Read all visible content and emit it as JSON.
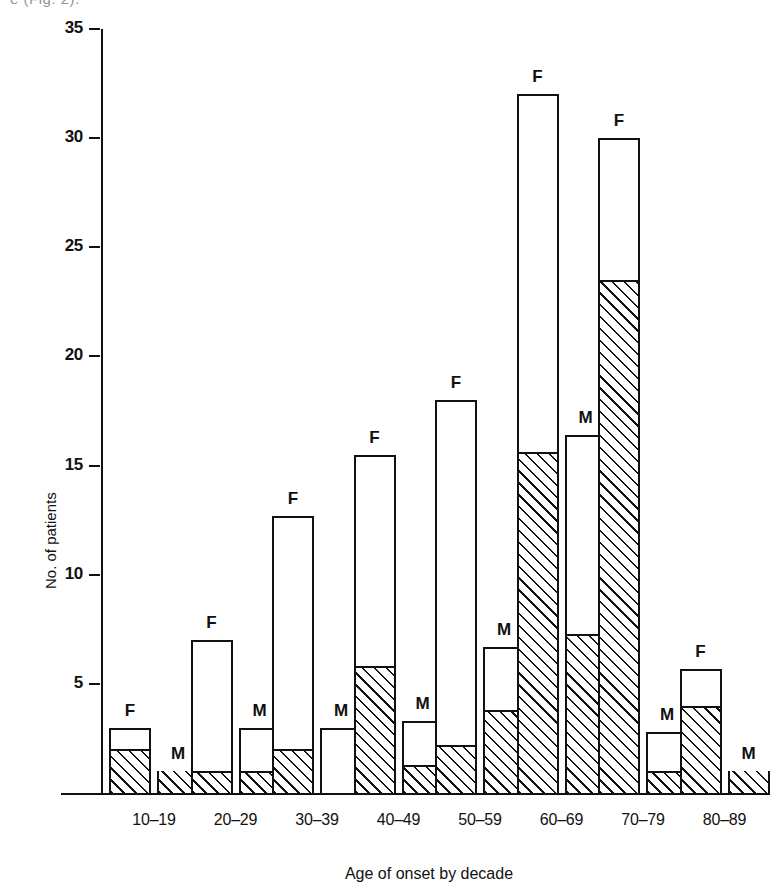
{
  "figure": {
    "top_fragment": "e (Fig. 2).",
    "axis_y_title": "No. of patients",
    "axis_x_title": "Age of onset by decade"
  },
  "chart_data": {
    "type": "bar",
    "title": "",
    "xlabel": "Age of onset by decade",
    "ylabel": "No. of patients",
    "ylim": [
      0,
      35
    ],
    "yticks": [
      5,
      10,
      15,
      20,
      25,
      30,
      35
    ],
    "grid": false,
    "legend": "none",
    "categories": [
      "10–19",
      "20–29",
      "30–39",
      "40–49",
      "50–59",
      "60–69",
      "70–79",
      "80–89"
    ],
    "bar_labels": [
      "F",
      "M"
    ],
    "series": [
      {
        "name": "F",
        "label": "F",
        "values": [
          3,
          7,
          12.7,
          15.5,
          18,
          32,
          30,
          5.7
        ],
        "hatched_values": [
          2,
          1,
          2,
          5.8,
          2.2,
          15.6,
          23.5,
          4
        ]
      },
      {
        "name": "M",
        "label": "M",
        "values": [
          1,
          3,
          3,
          3.3,
          6.7,
          16.4,
          2.8,
          1
        ],
        "hatched_values": [
          1,
          1,
          0,
          1.3,
          3.8,
          7.3,
          1,
          1
        ]
      }
    ]
  }
}
